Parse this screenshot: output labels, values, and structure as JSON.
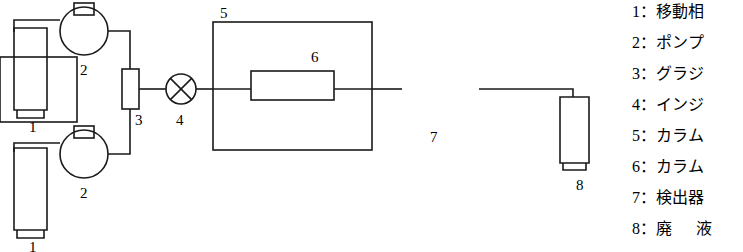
{
  "diagram": {
    "stroke_color": "#1a1a1a",
    "background": "#ffffff",
    "component_labels": [
      {
        "id": "1a",
        "text": "1",
        "x": 29,
        "y": 127
      },
      {
        "id": "2a",
        "text": "2",
        "x": 80,
        "y": 72
      },
      {
        "id": "2b",
        "text": "2",
        "x": 80,
        "y": 195
      },
      {
        "id": "1b",
        "text": "1",
        "x": 29,
        "y": 243
      },
      {
        "id": "3",
        "text": "3",
        "x": 137,
        "y": 122
      },
      {
        "id": "4",
        "text": "4",
        "x": 178,
        "y": 122
      },
      {
        "id": "5",
        "text": "5",
        "x": 220,
        "y": 27
      },
      {
        "id": "6",
        "text": "6",
        "x": 313,
        "y": 65
      },
      {
        "id": "7",
        "text": "7",
        "x": 432,
        "y": 142
      },
      {
        "id": "8",
        "text": "8",
        "x": 578,
        "y": 172
      }
    ]
  },
  "legend": {
    "items": [
      {
        "num": "1",
        "colon": "：",
        "text": "移動相"
      },
      {
        "num": "2",
        "colon": "：",
        "text": "ポンプ"
      },
      {
        "num": "3",
        "colon": "：",
        "text": "グラジ"
      },
      {
        "num": "4",
        "colon": "：",
        "text": "インジ"
      },
      {
        "num": "5",
        "colon": "：",
        "text": "カラム"
      },
      {
        "num": "6",
        "colon": "：",
        "text": "カラム"
      },
      {
        "num": "7",
        "colon": "：",
        "text": "検出器"
      },
      {
        "num": "8",
        "colon": "：",
        "text": "廃　液"
      }
    ]
  }
}
